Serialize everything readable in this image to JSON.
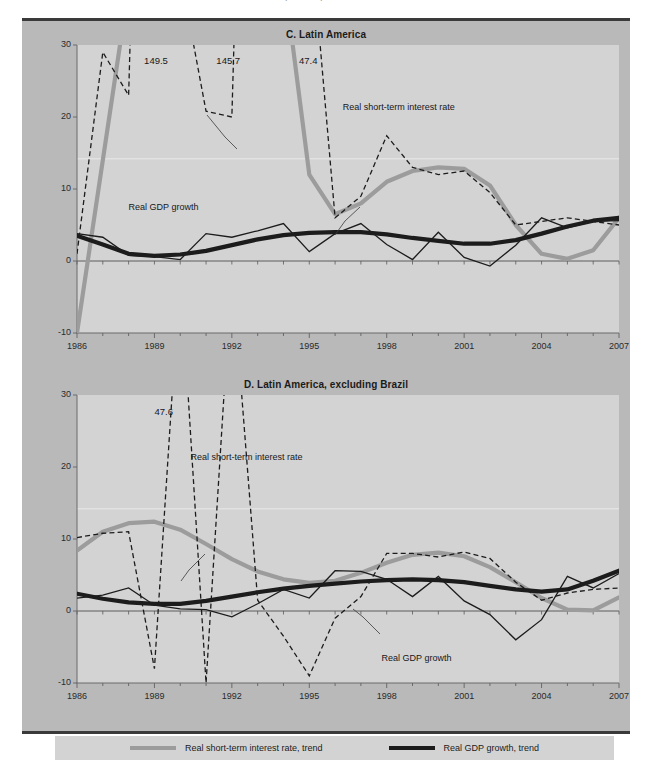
{
  "top_remnant_text": "(Percent)",
  "legend": {
    "items": [
      {
        "label": "Real short-term interest rate, trend",
        "color": "#9c9c9c",
        "style": "solid-thick"
      },
      {
        "label": "Real GDP growth, trend",
        "color": "#1c1c1c",
        "style": "solid-thick"
      }
    ]
  },
  "chart_data": [
    {
      "type": "line",
      "title": "C. Latin America",
      "xlabel": "",
      "ylabel": "",
      "xlim": [
        1986,
        2007
      ],
      "ylim": [
        -10,
        30
      ],
      "yticks": [
        -10,
        0,
        10,
        20,
        30
      ],
      "xticks": [
        1986,
        1989,
        1992,
        1995,
        1998,
        2001,
        2004,
        2007
      ],
      "grid": false,
      "legend_position": "figure-bottom",
      "annotations": [
        {
          "text": "149.5",
          "x": 1988.6,
          "y": 27.8
        },
        {
          "text": "145.7",
          "x": 1991.4,
          "y": 27.8
        },
        {
          "text": "47.4",
          "x": 1994.6,
          "y": 27.8
        },
        {
          "text": "Real short-term interest rate",
          "x": 1996.3,
          "y": 21.2
        },
        {
          "text": "Real GDP growth",
          "x": 1988.0,
          "y": 7.4
        }
      ],
      "x": [
        1986,
        1987,
        1988,
        1989,
        1990,
        1991,
        1992,
        1993,
        1994,
        1995,
        1996,
        1997,
        1998,
        1999,
        2000,
        2001,
        2002,
        2003,
        2004,
        2005,
        2006,
        2007
      ],
      "series": [
        {
          "name": "Real short-term interest rate",
          "style": "dashed-thin",
          "color": "#1c1c1c",
          "values": [
            1.0,
            29.0,
            23.0,
            149.5,
            40.0,
            20.8,
            20.0,
            145.7,
            31.0,
            47.4,
            6.0,
            9.0,
            17.4,
            13.0,
            12.0,
            12.5,
            9.5,
            5.0,
            5.5,
            6.0,
            5.5,
            5.0
          ]
        },
        {
          "name": "Real short-term interest rate, trend",
          "style": "solid-thick",
          "color": "#9c9c9c",
          "values": [
            -10.0,
            14.0,
            38.0,
            52.0,
            62.0,
            72.0,
            84.0,
            90.0,
            40.0,
            12.0,
            6.5,
            8.0,
            11.0,
            12.5,
            13.0,
            12.8,
            10.5,
            5.0,
            1.0,
            0.3,
            1.5,
            6.0
          ]
        },
        {
          "name": "Real GDP growth",
          "style": "solid-thin",
          "color": "#1c1c1c",
          "values": [
            3.8,
            3.3,
            0.8,
            0.6,
            0.2,
            3.8,
            3.3,
            4.2,
            5.2,
            1.3,
            3.8,
            5.2,
            2.3,
            0.2,
            4.0,
            0.5,
            -0.7,
            2.2,
            6.0,
            4.6,
            5.5,
            5.6
          ]
        },
        {
          "name": "Real GDP growth, trend",
          "style": "solid-thick",
          "color": "#1c1c1c",
          "values": [
            3.5,
            2.3,
            1.0,
            0.7,
            0.9,
            1.4,
            2.2,
            3.0,
            3.6,
            3.9,
            4.0,
            4.0,
            3.7,
            3.2,
            2.8,
            2.4,
            2.4,
            2.9,
            3.8,
            4.8,
            5.6,
            6.0
          ]
        }
      ]
    },
    {
      "type": "line",
      "title": "D. Latin America, excluding Brazil",
      "xlabel": "",
      "ylabel": "",
      "xlim": [
        1986,
        2007
      ],
      "ylim": [
        -10,
        30
      ],
      "yticks": [
        -10,
        0,
        10,
        20,
        30
      ],
      "xticks": [
        1986,
        1989,
        1992,
        1995,
        1998,
        2001,
        2004,
        2007
      ],
      "grid": false,
      "legend_position": "figure-bottom",
      "annotations": [
        {
          "text": "47.6",
          "x": 1989.0,
          "y": 27.6
        },
        {
          "text": "Real short-term interest rate",
          "x": 1990.4,
          "y": 21.2
        },
        {
          "text": "Real GDP growth",
          "x": 1997.8,
          "y": -6.6
        }
      ],
      "x": [
        1986,
        1987,
        1988,
        1989,
        1990,
        1991,
        1992,
        1993,
        1994,
        1995,
        1996,
        1997,
        1998,
        1999,
        2000,
        2001,
        2002,
        2003,
        2004,
        2005,
        2006,
        2007
      ],
      "series": [
        {
          "name": "Real short-term interest rate",
          "style": "dashed-thin",
          "color": "#1c1c1c",
          "values": [
            10.2,
            10.8,
            11.0,
            -8.0,
            47.6,
            -10.0,
            47.6,
            1.5,
            -3.5,
            -9.0,
            -1.0,
            2.0,
            8.0,
            8.0,
            7.5,
            8.2,
            7.3,
            4.0,
            1.5,
            2.5,
            3.0,
            3.2
          ]
        },
        {
          "name": "Real short-term interest rate, trend",
          "style": "solid-thick",
          "color": "#9c9c9c",
          "values": [
            8.4,
            11.0,
            12.2,
            12.4,
            11.3,
            9.3,
            7.2,
            5.5,
            4.4,
            3.9,
            4.2,
            5.3,
            6.7,
            7.8,
            8.1,
            7.6,
            6.1,
            4.0,
            1.8,
            0.2,
            0.1,
            1.9
          ]
        },
        {
          "name": "Real GDP growth",
          "style": "solid-thin",
          "color": "#1c1c1c",
          "values": [
            1.8,
            2.2,
            3.2,
            0.8,
            0.3,
            0.2,
            -0.8,
            1.0,
            3.0,
            1.8,
            5.6,
            5.5,
            4.4,
            2.0,
            4.8,
            1.4,
            -0.5,
            -4.0,
            -1.2,
            4.8,
            3.2,
            5.2
          ]
        },
        {
          "name": "Real GDP growth, trend",
          "style": "solid-thick",
          "color": "#1c1c1c",
          "values": [
            2.4,
            1.7,
            1.2,
            1.0,
            1.0,
            1.4,
            2.0,
            2.6,
            3.1,
            3.5,
            3.8,
            4.1,
            4.3,
            4.4,
            4.3,
            4.0,
            3.5,
            3.0,
            2.7,
            3.0,
            4.2,
            5.6
          ]
        }
      ]
    }
  ]
}
